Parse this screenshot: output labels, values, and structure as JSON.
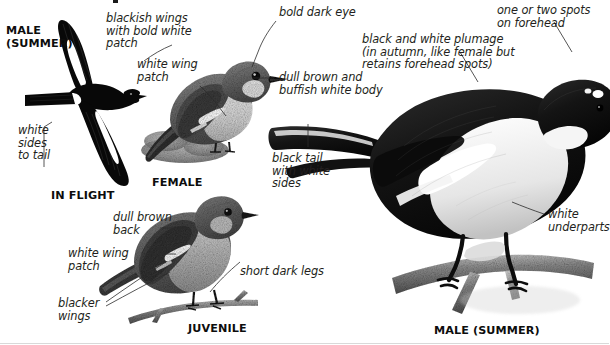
{
  "plate": {
    "subject": "Pied Flycatcher",
    "background_color": "#ffffff",
    "ink_color": "#231f20",
    "leader_color": "#2b2b2b"
  },
  "captions": [
    {
      "id": "male-summer-flight",
      "text": "MALE\n(SUMMER)"
    },
    {
      "id": "in-flight",
      "text": "IN FLIGHT"
    },
    {
      "id": "female",
      "text": "FEMALE"
    },
    {
      "id": "juvenile",
      "text": "JUVENILE"
    },
    {
      "id": "male-summer-perched",
      "text": "MALE (SUMMER)"
    }
  ],
  "annotations": [
    {
      "id": "blackish-wings",
      "text": "blackish wings\nwith bold white\npatch"
    },
    {
      "id": "white-sides-tail",
      "text": "white\nsides\nto tail"
    },
    {
      "id": "white-wing-patch-female",
      "text": "white wing\npatch"
    },
    {
      "id": "bold-dark-eye",
      "text": "bold dark eye"
    },
    {
      "id": "dull-brown-body",
      "text": "dull brown and\nbuffish white body"
    },
    {
      "id": "black-tail-white-sides",
      "text": "black tail\nwith white\nsides"
    },
    {
      "id": "black-white-plumage",
      "text": "black and white plumage\n(in autumn, like female but\nretains forehead spots)"
    },
    {
      "id": "forehead-spots",
      "text": "one or two spots\non forehead"
    },
    {
      "id": "white-underparts",
      "text": "white\nunderparts"
    },
    {
      "id": "dull-brown-back",
      "text": "dull brown\nback"
    },
    {
      "id": "white-wing-patch-juv",
      "text": "white wing\npatch"
    },
    {
      "id": "blacker-wings",
      "text": "blacker\nwings"
    },
    {
      "id": "short-dark-legs",
      "text": "short dark legs"
    }
  ]
}
